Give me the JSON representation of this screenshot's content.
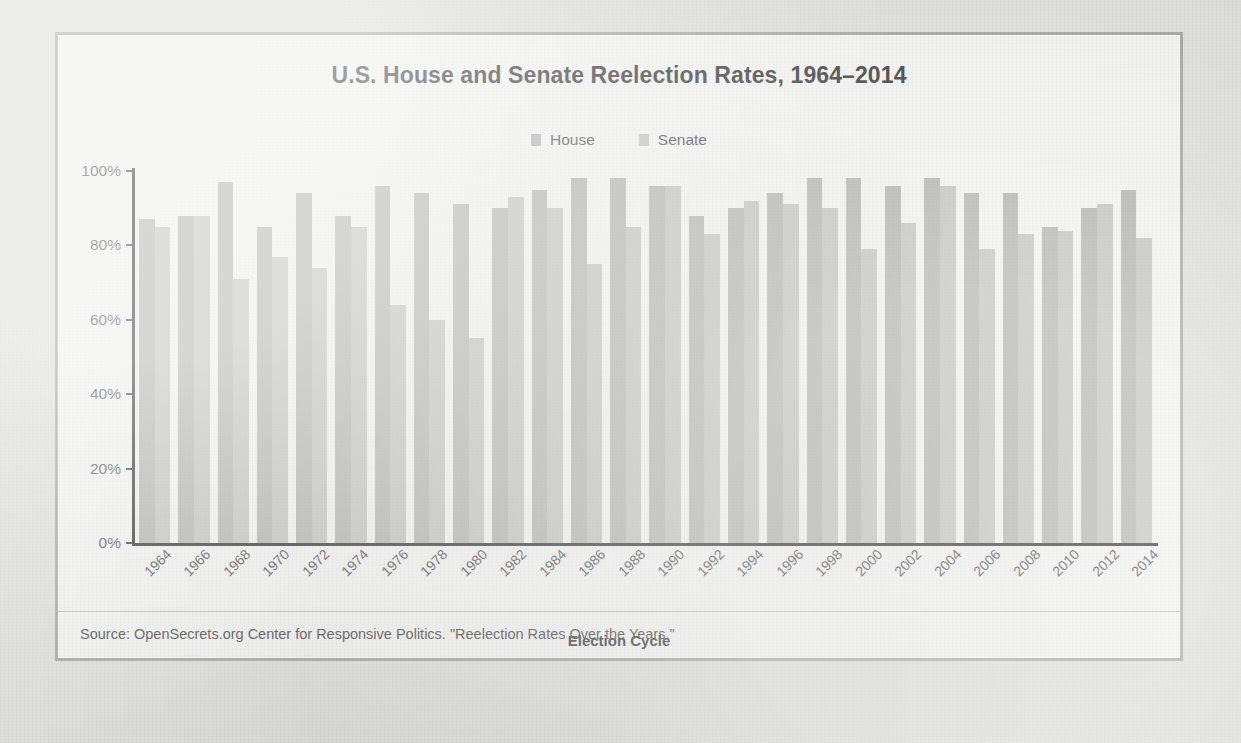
{
  "figure": {
    "title": "U.S. House and Senate Reelection Rates, 1964–2014",
    "xaxis_title": "Election Cycle",
    "source": "Source: OpenSecrets.org Center for Responsive Politics. \"Reelection Rates Over the Years.\"",
    "frame_color": "#9c9c9a",
    "background_color": "#eeeeec"
  },
  "legend": {
    "position": "top-center",
    "items": [
      {
        "label": "House",
        "color": "#a8a8a6",
        "swatch_name": "legend-swatch-house"
      },
      {
        "label": "Senate",
        "color": "#b9b9b7",
        "swatch_name": "legend-swatch-senate"
      }
    ]
  },
  "yaxis": {
    "ticks": [
      "0%",
      "20%",
      "40%",
      "60%",
      "80%",
      "100%"
    ],
    "min": 0,
    "max": 100
  },
  "chart_data": {
    "type": "bar",
    "title": "U.S. House and Senate Reelection Rates, 1964–2014",
    "subtitle": "",
    "xlabel": "Election Cycle",
    "ylabel": "",
    "ylim": [
      0,
      100
    ],
    "yticks": [
      0,
      20,
      40,
      60,
      80,
      100
    ],
    "ytick_labels": [
      "0%",
      "20%",
      "40%",
      "60%",
      "80%",
      "100%"
    ],
    "grid": false,
    "legend_position": "top-center",
    "units": "percent",
    "categories": [
      "1964",
      "1966",
      "1968",
      "1970",
      "1972",
      "1974",
      "1976",
      "1978",
      "1980",
      "1982",
      "1984",
      "1986",
      "1988",
      "1990",
      "1992",
      "1994",
      "1996",
      "1998",
      "2000",
      "2002",
      "2004",
      "2006",
      "2008",
      "2010",
      "2012",
      "2014"
    ],
    "series": [
      {
        "name": "House",
        "color": "#a8a8a6",
        "values": [
          87,
          88,
          97,
          85,
          94,
          88,
          96,
          94,
          91,
          90,
          95,
          98,
          98,
          96,
          88,
          90,
          94,
          98,
          98,
          96,
          98,
          94,
          94,
          85,
          90,
          95
        ]
      },
      {
        "name": "Senate",
        "color": "#b9b9b7",
        "values": [
          85,
          88,
          71,
          77,
          74,
          85,
          64,
          60,
          55,
          93,
          90,
          75,
          85,
          96,
          83,
          92,
          91,
          90,
          79,
          86,
          96,
          79,
          83,
          84,
          91,
          82
        ]
      }
    ]
  }
}
